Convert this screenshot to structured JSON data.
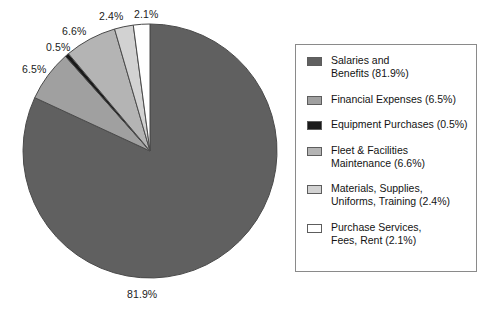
{
  "chart_data": {
    "type": "pie",
    "title": "",
    "labels": [
      "Salaries and Benefits",
      "Financial Expenses",
      "Equipment Purchases",
      "Fleet & Facilities Maintenance",
      "Materials, Supplies, Uniforms, Training",
      "Purchase Services, Fees, Rent"
    ],
    "values": [
      81.9,
      6.5,
      0.5,
      6.6,
      2.4,
      2.1
    ],
    "unit": "%",
    "start_angle_deg": 0,
    "direction": "clockwise",
    "legend_position": "right",
    "grid": false,
    "colors": [
      "#606060",
      "#a0a0a0",
      "#1a1a1a",
      "#b4b4b4",
      "#d2d2d2",
      "#ffffff"
    ],
    "slice_label_texts": [
      "81.9%",
      "6.5%",
      "0.5%",
      "6.6%",
      "2.4%",
      "2.1%"
    ]
  },
  "pie": {
    "center_x": 150,
    "center_y": 151,
    "radius": 127,
    "stroke": "#4a4a4a",
    "labels": [
      {
        "text": "81.9%",
        "left": 127,
        "top": 288
      },
      {
        "text": "6.5%",
        "left": 22,
        "top": 63
      },
      {
        "text": "0.5%",
        "left": 46,
        "top": 41
      },
      {
        "text": "6.6%",
        "left": 62,
        "top": 25
      },
      {
        "text": "2.4%",
        "left": 99,
        "top": 10
      },
      {
        "text": "2.1%",
        "left": 134,
        "top": 8
      }
    ]
  },
  "legend": {
    "items": [
      {
        "swatch": "#606060",
        "text": "Salaries and\nBenefits (81.9%)"
      },
      {
        "swatch": "#a0a0a0",
        "text": "Financial Expenses (6.5%)"
      },
      {
        "swatch": "#1a1a1a",
        "text": "Equipment Purchases (0.5%)"
      },
      {
        "swatch": "#b4b4b4",
        "text": "Fleet & Facilities\nMaintenance (6.6%)"
      },
      {
        "swatch": "#d2d2d2",
        "text": "Materials, Supplies,\nUniforms, Training (2.4%)"
      },
      {
        "swatch": "#ffffff",
        "text": "Purchase Services,\nFees, Rent (2.1%)"
      }
    ]
  }
}
